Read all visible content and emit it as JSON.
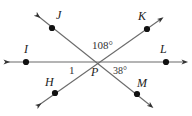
{
  "figure": {
    "type": "geometry-diagram",
    "background_color": "#ffffff",
    "line_color": "#666666",
    "dot_color": "#111111",
    "text_color": "#222222"
  },
  "vertex": {
    "name": "P",
    "label": "P",
    "x": 95,
    "y": 62,
    "label_x": 91,
    "label_y": 66
  },
  "points": [
    {
      "id": "J",
      "label": "J",
      "dot_x": 52,
      "dot_y": 28,
      "label_x": 56,
      "label_y": 9,
      "arrow_x": 38,
      "arrow_y": 16
    },
    {
      "id": "K",
      "label": "K",
      "dot_x": 147,
      "dot_y": 29,
      "label_x": 138,
      "label_y": 10,
      "arrow_x": 161,
      "arrow_y": 19
    },
    {
      "id": "I",
      "label": "I",
      "dot_x": 26,
      "dot_y": 62,
      "label_x": 24,
      "label_y": 43,
      "arrow_x": 7,
      "arrow_y": 62
    },
    {
      "id": "L",
      "label": "L",
      "dot_x": 166,
      "dot_y": 62,
      "label_x": 160,
      "label_y": 43,
      "arrow_x": 185,
      "arrow_y": 62
    },
    {
      "id": "H",
      "label": "H",
      "dot_x": 55,
      "dot_y": 93,
      "label_x": 45,
      "label_y": 76,
      "arrow_x": 39,
      "arrow_y": 105
    },
    {
      "id": "M",
      "label": "M",
      "dot_x": 137,
      "dot_y": 94,
      "label_x": 137,
      "label_y": 77,
      "arrow_x": 151,
      "arrow_y": 106
    }
  ],
  "lines": [
    {
      "id": "line-IL",
      "from": "I",
      "to": "L",
      "x1": 7,
      "y1": 62,
      "x2": 185,
      "y2": 62
    },
    {
      "id": "line-JM",
      "from": "J",
      "to": "M",
      "x1": 38,
      "y1": 16,
      "x2": 151,
      "y2": 106
    },
    {
      "id": "line-HK",
      "from": "H",
      "to": "K",
      "x1": 39,
      "y1": 105,
      "x2": 161,
      "y2": 19
    }
  ],
  "angles": [
    {
      "id": "angle-JPK",
      "label": "108°",
      "value": 108,
      "unit": "degrees",
      "x": 92,
      "y": 40
    },
    {
      "id": "angle-LPM",
      "label": "38°",
      "value": 38,
      "unit": "degrees",
      "x": 113,
      "y": 66
    },
    {
      "id": "angle-1",
      "label": "1",
      "x": 69,
      "y": 65
    }
  ]
}
